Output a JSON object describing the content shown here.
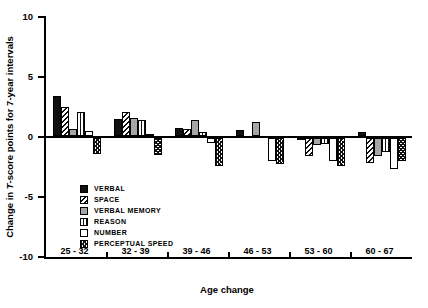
{
  "figure": {
    "y_axis_title_parts": {
      "pre": "Change in ",
      "italic": "T",
      "post": "-score points for 7-year intervals"
    },
    "x_axis_title": "Age change"
  },
  "colors": {
    "background": "#ffffff",
    "axis": "#000000",
    "bar_black": "#111111",
    "bar_gray": "#a6a6a6",
    "bar_white": "#ffffff"
  },
  "chart_data": {
    "type": "bar",
    "title": "",
    "xlabel": "Age change",
    "ylabel": "Change in T-score points for 7-year intervals",
    "ylim": [
      -10,
      10
    ],
    "yticks": [
      10,
      5,
      0,
      -5,
      -10
    ],
    "grid": false,
    "legend_position": "inside-lower-left",
    "categories": [
      "25 - 32",
      "32 - 39",
      "39 - 46",
      "46 - 53",
      "53 - 60",
      "60 - 67"
    ],
    "series": [
      {
        "name": "VERBAL",
        "pattern": "solid-black",
        "values": [
          3.3,
          1.4,
          0.7,
          0.5,
          -0.2,
          0.3
        ]
      },
      {
        "name": "SPACE",
        "pattern": "diagonal-hatch",
        "values": [
          2.4,
          2.0,
          0.6,
          0.0,
          -1.5,
          -2.1
        ]
      },
      {
        "name": "VERBAL MEMORY",
        "pattern": "solid-gray",
        "values": [
          0.6,
          1.5,
          1.3,
          1.2,
          -0.6,
          -1.5
        ]
      },
      {
        "name": "REASON",
        "pattern": "vertical-lines",
        "values": [
          2.0,
          1.3,
          0.3,
          0.0,
          -0.5,
          -1.2
        ]
      },
      {
        "name": "NUMBER",
        "pattern": "white",
        "values": [
          0.4,
          0.2,
          -0.4,
          -1.9,
          -1.9,
          -2.6
        ]
      },
      {
        "name": "PERCEPTUAL SPEED",
        "pattern": "cross-hatch",
        "values": [
          -1.3,
          -1.4,
          -2.3,
          -2.2,
          -2.3,
          -1.9
        ]
      }
    ]
  }
}
